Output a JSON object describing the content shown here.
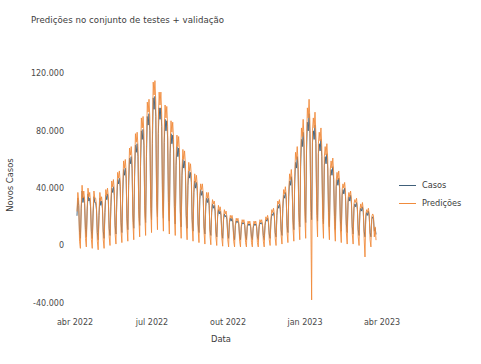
{
  "figure": {
    "title": "Predições no conjunto de testes + validação",
    "background": "#ffffff",
    "text_color": "#3c3c3c"
  },
  "axes": {
    "ylabel": "Novos Casos",
    "xlabel": "Data",
    "yticks": [
      "120.000",
      "80.000",
      "40.000",
      "0",
      "-40.000"
    ],
    "xticks": [
      "abr 2022",
      "jul 2022",
      "out 2022",
      "jan 2023",
      "abr 2023"
    ]
  },
  "legend": {
    "position": "right",
    "entries": [
      {
        "label": "Casos",
        "color": "#40607a"
      },
      {
        "label": "Predições",
        "color": "#f08b3c"
      }
    ]
  },
  "chart_data": {
    "type": "line",
    "title": "Predições no conjunto de testes + validação",
    "xlabel": "Data",
    "ylabel": "Novos Casos",
    "xlim": [
      "2022-03-26",
      "2023-04-12"
    ],
    "ylim": [
      -45000,
      128000
    ],
    "yticks": [
      120000,
      80000,
      40000,
      0,
      -40000
    ],
    "ytick_labels": [
      "120.000",
      "80.000",
      "40.000",
      "0",
      "-40.000"
    ],
    "xticks": [
      "2022-04-01",
      "2022-07-01",
      "2022-10-01",
      "2023-01-01",
      "2023-04-01"
    ],
    "xtick_labels": [
      "abr 2022",
      "jul 2022",
      "out 2022",
      "jan 2023",
      "abr 2023"
    ],
    "grid": false,
    "x_start": "2022-03-28",
    "x_end": "2023-03-20",
    "sample_interval_days": 1,
    "legend_position": "right",
    "series": [
      {
        "name": "Casos",
        "color": "#40607a",
        "linewidth": 0.9,
        "values": [
          21000,
          33000,
          28000,
          9000,
          5000,
          26000,
          38000,
          30000,
          34000,
          29000,
          11000,
          6000,
          24000,
          36000,
          31000,
          33000,
          27000,
          10000,
          5000,
          22000,
          34000,
          30000,
          30000,
          25000,
          9000,
          4000,
          21000,
          33000,
          28000,
          31000,
          26000,
          10000,
          5000,
          23000,
          35000,
          32000,
          36000,
          31000,
          12000,
          7000,
          27000,
          40000,
          37000,
          41000,
          35000,
          14000,
          8000,
          31000,
          46000,
          43000,
          47000,
          41000,
          16000,
          9000,
          36000,
          53000,
          49000,
          54000,
          47000,
          19000,
          11000,
          42000,
          61000,
          57000,
          62000,
          54000,
          22000,
          12000,
          48000,
          70000,
          65000,
          71000,
          62000,
          25000,
          14000,
          55000,
          80000,
          74000,
          81000,
          70000,
          28000,
          16000,
          62000,
          90000,
          84000,
          92000,
          80000,
          32000,
          18000,
          71000,
          103000,
          95000,
          104000,
          90000,
          36000,
          20000,
          78000,
          96000,
          88000,
          96000,
          83000,
          33000,
          19000,
          72000,
          88000,
          80000,
          87000,
          75000,
          30000,
          17000,
          64000,
          78000,
          71000,
          77000,
          67000,
          27000,
          15000,
          56000,
          69000,
          62000,
          68000,
          59000,
          24000,
          13000,
          49000,
          60000,
          54000,
          59000,
          51000,
          21000,
          12000,
          42000,
          52000,
          47000,
          51000,
          44000,
          18000,
          10000,
          37000,
          45000,
          40000,
          44000,
          38000,
          15000,
          9000,
          32000,
          39000,
          35000,
          38000,
          33000,
          13000,
          8000,
          27000,
          33000,
          30000,
          33000,
          28000,
          11000,
          7000,
          23000,
          29000,
          26000,
          28000,
          24000,
          10000,
          6000,
          20000,
          25000,
          22000,
          24000,
          21000,
          9000,
          5000,
          18000,
          22000,
          20000,
          21000,
          18000,
          8000,
          5000,
          16000,
          19000,
          17000,
          19000,
          16000,
          7000,
          4000,
          14000,
          17000,
          16000,
          17000,
          15000,
          6000,
          4000,
          13000,
          16000,
          15000,
          16000,
          14000,
          6000,
          4000,
          13000,
          15000,
          14000,
          15000,
          13000,
          6000,
          4000,
          12000,
          15000,
          14000,
          15000,
          13000,
          6000,
          4000,
          13000,
          16000,
          15000,
          16000,
          14000,
          7000,
          4000,
          14000,
          18000,
          17000,
          19000,
          16000,
          8000,
          5000,
          17000,
          22000,
          21000,
          23000,
          20000,
          9000,
          6000,
          21000,
          28000,
          26000,
          29000,
          25000,
          11000,
          7000,
          26000,
          35000,
          33000,
          37000,
          32000,
          14000,
          9000,
          34000,
          45000,
          42000,
          48000,
          41000,
          18000,
          11000,
          43000,
          58000,
          54000,
          62000,
          53000,
          23000,
          13000,
          55000,
          74000,
          69000,
          79000,
          68000,
          29000,
          16000,
          66000,
          86000,
          80000,
          92000,
          78000,
          33000,
          18000,
          72000,
          80000,
          74000,
          84000,
          71000,
          30000,
          17000,
          64000,
          71000,
          66000,
          74000,
          62000,
          27000,
          15000,
          56000,
          62000,
          57000,
          64000,
          54000,
          23000,
          13000,
          48000,
          53000,
          49000,
          55000,
          46000,
          20000,
          11000,
          41000,
          46000,
          42000,
          47000,
          40000,
          17000,
          10000,
          35000,
          39000,
          36000,
          40000,
          34000,
          15000,
          9000,
          30000,
          34000,
          31000,
          35000,
          29000,
          13000,
          8000,
          26000,
          29000,
          27000,
          30000,
          25000,
          11000,
          7000,
          23000,
          26000,
          24000,
          27000,
          23000,
          10000,
          6000,
          20000,
          23000,
          21000,
          24000,
          20000,
          9000,
          6000,
          18000,
          20000,
          19000,
          10000,
          12000,
          8000
        ]
      },
      {
        "name": "Predições",
        "color": "#f08b3c",
        "linewidth": 0.9,
        "values": [
          24000,
          37000,
          31000,
          3000,
          -2000,
          28000,
          42000,
          33000,
          38000,
          32000,
          5000,
          -1000,
          26000,
          40000,
          34000,
          37000,
          30000,
          4000,
          -2000,
          24000,
          38000,
          33000,
          33000,
          28000,
          3000,
          -3000,
          23000,
          37000,
          31000,
          34000,
          29000,
          4000,
          -2000,
          25000,
          39000,
          35000,
          40000,
          34000,
          6000,
          0,
          30000,
          45000,
          41000,
          46000,
          39000,
          8000,
          1000,
          34000,
          51000,
          47000,
          52000,
          45000,
          10000,
          2000,
          40000,
          59000,
          54000,
          60000,
          52000,
          13000,
          3000,
          46000,
          68000,
          63000,
          69000,
          60000,
          16000,
          4000,
          53000,
          78000,
          72000,
          79000,
          69000,
          19000,
          6000,
          61000,
          89000,
          82000,
          90000,
          78000,
          22000,
          7000,
          69000,
          100000,
          93000,
          102000,
          89000,
          26000,
          9000,
          79000,
          114000,
          105000,
          115000,
          100000,
          30000,
          11000,
          87000,
          107000,
          98000,
          107000,
          92000,
          27000,
          10000,
          80000,
          98000,
          89000,
          97000,
          83000,
          24000,
          8000,
          71000,
          87000,
          79000,
          86000,
          74000,
          21000,
          7000,
          62000,
          77000,
          69000,
          76000,
          65000,
          18000,
          5000,
          54000,
          67000,
          60000,
          66000,
          57000,
          15000,
          4000,
          47000,
          58000,
          52000,
          57000,
          49000,
          13000,
          3000,
          41000,
          50000,
          44000,
          49000,
          42000,
          11000,
          2000,
          35000,
          43000,
          39000,
          43000,
          36000,
          9000,
          1000,
          30000,
          37000,
          33000,
          37000,
          31000,
          7000,
          500,
          26000,
          32000,
          29000,
          31000,
          27000,
          6000,
          0,
          22000,
          28000,
          24000,
          27000,
          23000,
          5000,
          -500,
          20000,
          25000,
          22000,
          24000,
          20000,
          4000,
          -1000,
          17000,
          21000,
          19000,
          21000,
          18000,
          3000,
          -1000,
          15000,
          19000,
          17000,
          19000,
          16000,
          3000,
          -1000,
          14000,
          18000,
          16000,
          18000,
          15000,
          2000,
          -1000,
          14000,
          17000,
          15000,
          17000,
          14000,
          2000,
          -1000,
          13000,
          17000,
          15000,
          17000,
          14000,
          2000,
          -1000,
          14000,
          18000,
          16000,
          18000,
          15000,
          3000,
          -1000,
          15000,
          20000,
          18000,
          21000,
          18000,
          4000,
          0,
          19000,
          25000,
          23000,
          26000,
          22000,
          5000,
          0,
          23000,
          31000,
          29000,
          32000,
          27000,
          7000,
          1000,
          29000,
          39000,
          36000,
          41000,
          35000,
          9000,
          2000,
          38000,
          50000,
          46000,
          53000,
          45000,
          12000,
          3000,
          48000,
          65000,
          60000,
          69000,
          58000,
          16000,
          4000,
          61000,
          82000,
          76000,
          88000,
          75000,
          20000,
          5000,
          73000,
          96000,
          89000,
          102000,
          86000,
          23000,
          -38000,
          80000,
          89000,
          82000,
          93000,
          78000,
          21000,
          6000,
          71000,
          79000,
          73000,
          82000,
          69000,
          18000,
          5000,
          62000,
          69000,
          63000,
          71000,
          60000,
          15000,
          4000,
          53000,
          59000,
          54000,
          61000,
          51000,
          13000,
          3000,
          45000,
          51000,
          46000,
          52000,
          44000,
          11000,
          2000,
          39000,
          43000,
          40000,
          44000,
          37000,
          9000,
          1000,
          33000,
          37000,
          34000,
          38000,
          32000,
          8000,
          1000,
          29000,
          32000,
          30000,
          33000,
          27000,
          6000,
          0,
          25000,
          29000,
          26000,
          30000,
          25000,
          5000,
          -8000,
          22000,
          25000,
          23000,
          26000,
          22000,
          4000,
          -1000,
          20000,
          22000,
          21000,
          6000,
          13000,
          4000
        ]
      }
    ]
  }
}
